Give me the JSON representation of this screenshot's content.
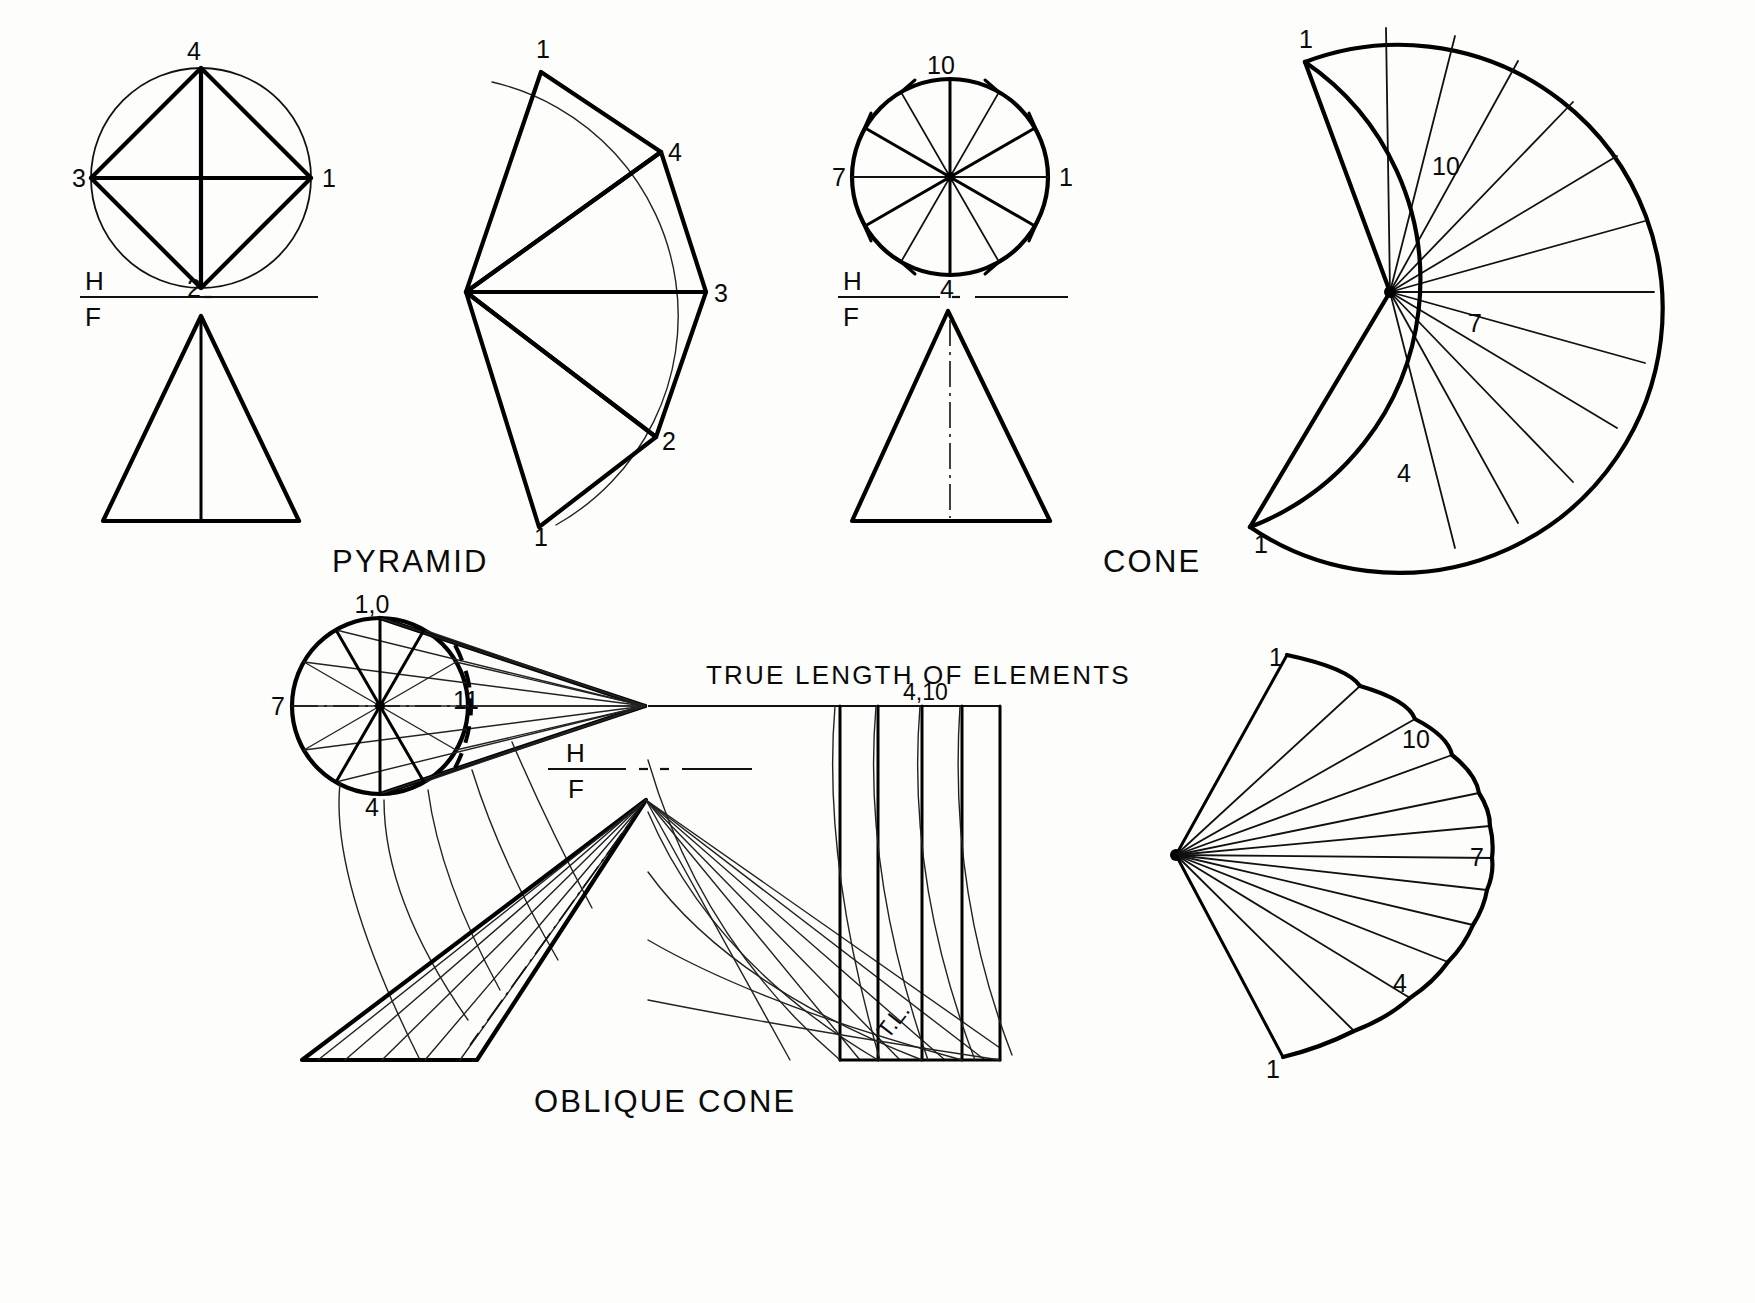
{
  "sheet": {
    "background_color": "#fdfdfb",
    "ink_color": "#000000"
  },
  "captions": {
    "pyramid": "PYRAMID",
    "cone": "CONE",
    "oblique_cone": "OBLIQUE   CONE",
    "true_length": "TRUE LENGTH OF ELEMENTS"
  },
  "reference_line": {
    "upper_label": "H",
    "lower_label": "F"
  },
  "pyramid": {
    "top_view": {
      "labels": {
        "top": "4",
        "right": "1",
        "bottom": "2",
        "left": "3"
      },
      "shape": "circle with inscribed square 1-2-3-4"
    },
    "development": {
      "labels": [
        "1",
        "4",
        "3",
        "2",
        "1"
      ],
      "panels": 4
    },
    "front_view": "triangle with vertical center element"
  },
  "cone": {
    "top_view": {
      "labels": {
        "top": "10",
        "right": "1",
        "bottom": "4",
        "left": "7"
      },
      "divisions": 12
    },
    "development": {
      "labels": [
        "1",
        "10",
        "7",
        "4",
        "1"
      ],
      "divisions": 12
    },
    "front_view": "triangle with dashed vertical axis"
  },
  "oblique_cone": {
    "top_view": {
      "labels": {
        "top": "1,0",
        "left": "7",
        "bottom": "4",
        "inner_dashed": "11"
      },
      "divisions": 12
    },
    "true_length_diagram": {
      "title": "TRUE LENGTH OF ELEMENTS",
      "top_label": "4,10",
      "tl_label": "T.L."
    },
    "development": {
      "labels": [
        "1",
        "10",
        "7",
        "4",
        "1"
      ],
      "divisions": 12
    },
    "front_view": "oblique triangle with element lines"
  },
  "icons": {
    "reference_line_icon": "hf-reference-line"
  }
}
